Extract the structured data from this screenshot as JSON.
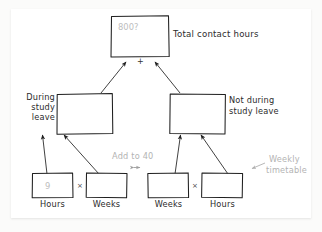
{
  "diagram": {
    "background_color": "#fbfbfa",
    "paper_color": "#ffffff",
    "ink_color": "#2b2b2b",
    "ghost_ink_color": "#b3b3b3",
    "nodes": {
      "total": {
        "value": "800?",
        "label": "Total contact hours"
      },
      "during": {
        "label_line1": "During",
        "label_line2": "study",
        "label_line3": "leave",
        "value": ""
      },
      "not_during": {
        "label_line1": "Not during",
        "label_line2": "study leave",
        "value": ""
      },
      "leaf_left_hours": {
        "value": "9",
        "label": "Hours"
      },
      "leaf_left_weeks": {
        "value": "",
        "label": "Weeks"
      },
      "leaf_right_weeks": {
        "value": "",
        "label": "Weeks"
      },
      "leaf_right_hours": {
        "value": "",
        "label": "Hours"
      }
    },
    "operators": {
      "sum_plus": "+",
      "left_multiply": "×",
      "right_multiply": "×"
    },
    "annotations": {
      "add_to_40": "Add to 40",
      "weekly_timetable_line1": "Weekly",
      "weekly_timetable_line2": "timetable"
    }
  }
}
